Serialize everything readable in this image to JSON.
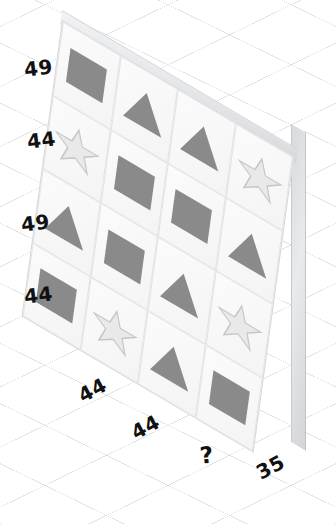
{
  "puzzle": {
    "title": "Shape grid sum puzzle",
    "grid": {
      "rows": 4,
      "cols": 4,
      "cells": [
        [
          {
            "shape": "square",
            "icon": "square-icon"
          },
          {
            "shape": "triangle",
            "icon": "triangle-icon"
          },
          {
            "shape": "triangle",
            "icon": "triangle-icon"
          },
          {
            "shape": "star",
            "icon": "star-icon"
          }
        ],
        [
          {
            "shape": "star",
            "icon": "star-icon"
          },
          {
            "shape": "square",
            "icon": "square-icon"
          },
          {
            "shape": "square",
            "icon": "square-icon"
          },
          {
            "shape": "triangle",
            "icon": "triangle-icon"
          }
        ],
        [
          {
            "shape": "triangle",
            "icon": "triangle-icon"
          },
          {
            "shape": "square",
            "icon": "square-icon"
          },
          {
            "shape": "triangle",
            "icon": "triangle-icon"
          },
          {
            "shape": "star",
            "icon": "star-icon"
          }
        ],
        [
          {
            "shape": "square",
            "icon": "square-icon"
          },
          {
            "shape": "star",
            "icon": "star-icon"
          },
          {
            "shape": "triangle",
            "icon": "triangle-icon"
          },
          {
            "shape": "square",
            "icon": "square-icon"
          }
        ]
      ]
    },
    "row_labels": [
      "49",
      "44",
      "49",
      "44"
    ],
    "col_labels": [
      "44",
      "44",
      "?",
      "35"
    ],
    "unknown_marker": "?",
    "colors": {
      "filled_shape": "#8a8a8a",
      "star_fill": "#e9e9e9",
      "star_stroke": "#c6c6c6",
      "cell_background": "#f7f7f8",
      "board_edge": "#d6d7da",
      "label_text": "#111111",
      "background_grid": "#c4c8d0"
    }
  }
}
